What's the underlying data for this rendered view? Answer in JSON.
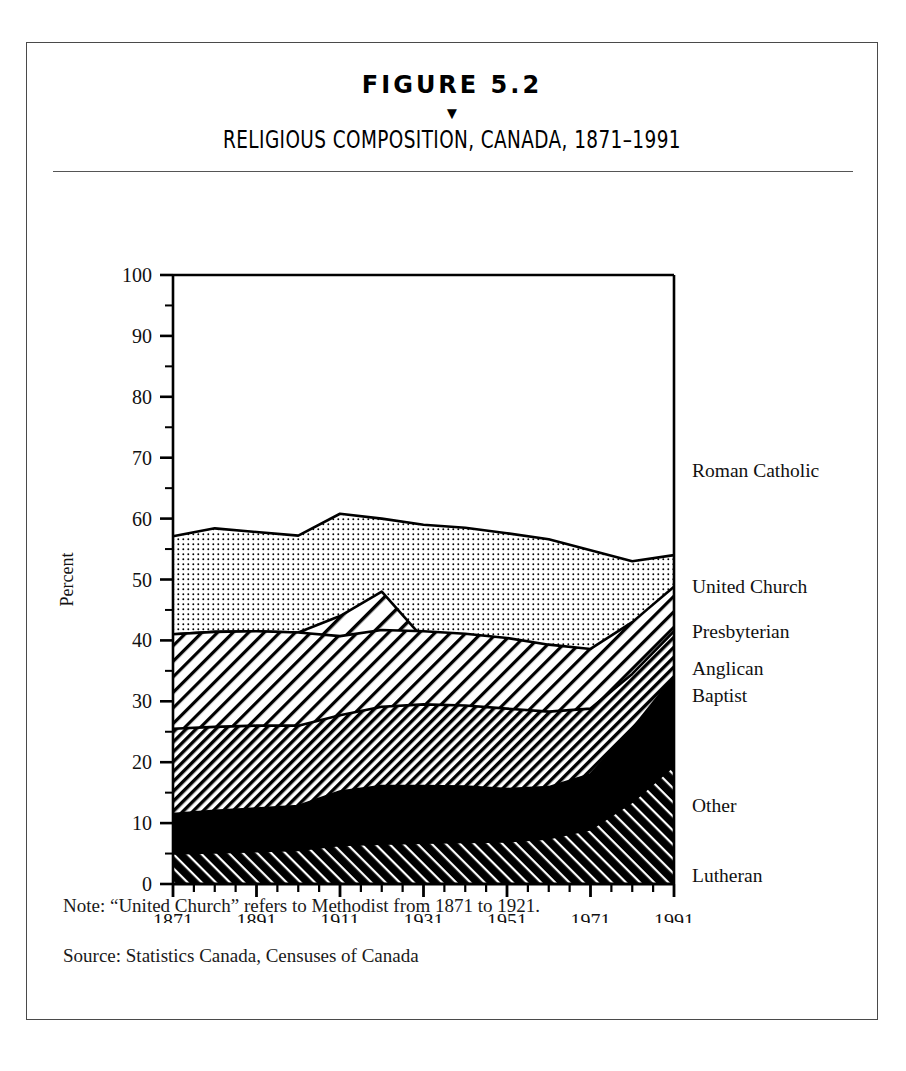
{
  "figure": {
    "number_label": "FIGURE 5.2",
    "marker_glyph": "▼",
    "title": "RELIGIOUS COMPOSITION, CANADA, 1871–1991"
  },
  "notes": {
    "note": "Note: “United Church” refers to Methodist from 1871 to 1921.",
    "source": "Source: Statistics Canada, Censuses of Canada"
  },
  "axis": {
    "ylabel": "Percent",
    "ytick_labels": [
      "100",
      "90",
      "80",
      "70",
      "60",
      "50",
      "40",
      "30",
      "20",
      "10",
      "0"
    ],
    "xtick_labels": [
      "1871",
      "1891",
      "1911",
      "1931",
      "1951",
      "1971",
      "1991"
    ]
  },
  "legend": {
    "items": [
      {
        "label": "Roman Catholic",
        "y_percent": 68
      },
      {
        "label": "United Church",
        "y_percent": 49
      },
      {
        "label": "Presbyterian",
        "y_percent": 41.5
      },
      {
        "label": "Anglican",
        "y_percent": 35.5
      },
      {
        "label": "Baptist",
        "y_percent": 31
      },
      {
        "label": "Other",
        "y_percent": 13
      },
      {
        "label": "Lutheran",
        "y_percent": 1.5
      }
    ]
  },
  "chart_data": {
    "type": "area",
    "title": "RELIGIOUS COMPOSITION, CANADA, 1871–1991",
    "xlabel": "",
    "ylabel": "Percent",
    "xlim": [
      1871,
      1991
    ],
    "ylim": [
      0,
      100
    ],
    "grid": false,
    "legend_position": "right-inline",
    "stacked": true,
    "x": [
      1871,
      1881,
      1891,
      1901,
      1911,
      1921,
      1931,
      1941,
      1951,
      1961,
      1971,
      1981,
      1991
    ],
    "series": [
      {
        "name": "Lutheran",
        "pattern": "black-with-white-dashes",
        "values": [
          5.0,
          5.2,
          5.4,
          5.6,
          6.4,
          6.6,
          6.8,
          6.9,
          7.0,
          7.5,
          9.0,
          13.5,
          19.5
        ]
      },
      {
        "name": "Other",
        "pattern": "solid-black",
        "values": [
          6.5,
          6.8,
          7.0,
          7.2,
          8.8,
          9.5,
          9.3,
          9.1,
          8.6,
          8.4,
          9.0,
          12.0,
          14.5
        ]
      },
      {
        "name": "Baptist",
        "pattern": "dense-diagonal-hatch",
        "values": [
          14.0,
          13.8,
          13.6,
          13.2,
          12.5,
          13.0,
          13.4,
          13.3,
          13.2,
          12.4,
          10.8,
          9.0,
          7.5
        ]
      },
      {
        "name": "Anglican",
        "pattern": "medium-diagonal-hatch",
        "values": [
          15.5,
          15.6,
          15.5,
          15.3,
          13.0,
          12.6,
          12.0,
          11.8,
          11.6,
          11.0,
          9.8,
          8.5,
          7.3
        ]
      },
      {
        "name": "Presbyterian",
        "pattern": "wide-diagonal-hatch",
        "values": [
          16.0,
          16.2,
          16.5,
          16.9,
          17.3,
          6.3,
          6.1,
          6.0,
          5.8,
          5.5,
          5.0,
          4.6,
          4.2
        ]
      },
      {
        "name": "United Church",
        "pattern": "fine-dot-stipple",
        "values": [
          16.5,
          17.0,
          17.2,
          17.4,
          17.8,
          18.0,
          17.6,
          17.2,
          16.8,
          16.0,
          14.2,
          12.6,
          11.3
        ]
      },
      {
        "name": "Roman Catholic",
        "pattern": "white",
        "values": [
          42.9,
          41.6,
          42.2,
          42.8,
          39.2,
          40.0,
          41.0,
          41.5,
          42.4,
          43.4,
          45.2,
          44.0,
          46.0
        ]
      }
    ],
    "cumulative_tops": {
      "Lutheran": [
        5.0,
        5.2,
        5.4,
        5.6,
        6.4,
        6.6,
        6.8,
        6.9,
        7.0,
        7.5,
        9.0,
        13.5,
        19.5
      ],
      "Other": [
        11.5,
        12.0,
        12.4,
        12.8,
        15.2,
        16.1,
        16.1,
        16.0,
        15.6,
        15.9,
        18.0,
        25.5,
        34.0
      ],
      "Baptist": [
        25.5,
        25.8,
        26.0,
        26.0,
        27.7,
        29.1,
        29.5,
        29.3,
        28.8,
        28.3,
        28.8,
        34.5,
        41.5
      ],
      "Anglican": [
        41.0,
        41.4,
        41.5,
        41.3,
        40.7,
        41.7,
        41.5,
        41.1,
        40.4,
        39.3,
        38.6,
        43.0,
        48.8
      ],
      "Presbyterian": [
        41.0,
        41.4,
        41.5,
        41.3,
        44.0,
        48.0,
        40.3,
        38.5,
        36.8,
        34.0,
        33.5,
        37.0,
        42.2
      ],
      "UnitedChurch": [
        57.1,
        58.4,
        57.8,
        57.2,
        60.8,
        60.0,
        59.0,
        58.5,
        57.6,
        56.6,
        54.8,
        53.0,
        54.0
      ],
      "RomanCatholic": [
        100,
        100,
        100,
        100,
        100,
        100,
        100,
        100,
        100,
        100,
        100,
        100,
        100
      ]
    }
  }
}
